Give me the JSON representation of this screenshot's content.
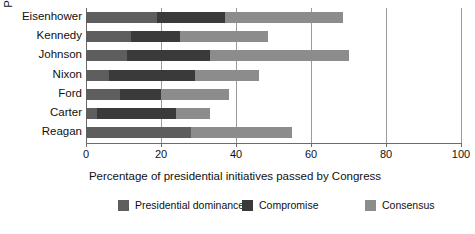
{
  "chart_data": {
    "type": "bar",
    "orientation": "horizontal",
    "stacked": true,
    "title": "",
    "xlabel": "Percentage of presidential initiatives passed by Congress",
    "ylabel": "President",
    "xlim": [
      0,
      100
    ],
    "xticks": [
      0,
      20,
      40,
      60,
      80,
      100
    ],
    "xtick_labels": [
      "0",
      "20",
      "40",
      "60",
      "80",
      "100"
    ],
    "grid": true,
    "legend_position": "bottom",
    "categories": [
      "Eisenhower",
      "Kennedy",
      "Johnson",
      "Nixon",
      "Ford",
      "Carter",
      "Reagan"
    ],
    "series": [
      {
        "name": "Presidential dominance",
        "color": "#5e5e5e",
        "values": [
          19,
          12,
          11,
          6,
          9,
          3,
          28
        ]
      },
      {
        "name": "Compromise",
        "color": "#3a3a3a",
        "values": [
          18,
          13,
          22,
          23,
          11,
          21,
          0
        ]
      },
      {
        "name": "Consensus",
        "color": "#8c8c8c",
        "values": [
          31.5,
          23.5,
          37,
          17,
          18,
          9,
          27
        ]
      }
    ],
    "totals": [
      68.5,
      48.5,
      70,
      46,
      38,
      33,
      55
    ]
  },
  "axes": {
    "y_title": "President",
    "x_title": "Percentage of presidential initiatives passed by Congress"
  },
  "legend": {
    "items": [
      {
        "label": "Presidential  dominance",
        "color": "#5e5e5e"
      },
      {
        "label": "Compromise",
        "color": "#3a3a3a"
      },
      {
        "label": "Consensus",
        "color": "#8c8c8c"
      }
    ]
  }
}
